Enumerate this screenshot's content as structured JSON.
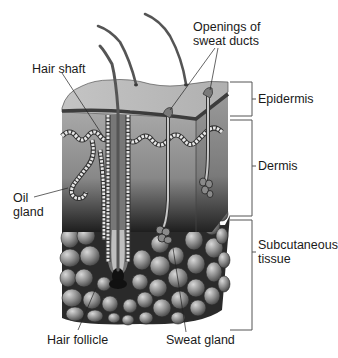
{
  "diagram": {
    "labels": {
      "hair_shaft": "Hair shaft",
      "openings_line1": "Openings of",
      "openings_line2": "sweat ducts",
      "epidermis": "Epidermis",
      "dermis": "Dermis",
      "oil_line1": "Oil",
      "oil_line2": "gland",
      "subcutaneous_line1": "Subcutaneous",
      "subcutaneous_line2": "tissue",
      "hair_follicle": "Hair follicle",
      "sweat_gland": "Sweat gland"
    },
    "layers": [
      {
        "name": "Epidermis"
      },
      {
        "name": "Dermis"
      },
      {
        "name": "Subcutaneous tissue"
      }
    ],
    "colors": {
      "background": "#ffffff",
      "epidermis": "#b5b5b5",
      "epidermis_band": "#4a4a4a",
      "dermis_top": "#9a9a9a",
      "dermis_bottom": "#2a2a2a",
      "fat_cell": "#8a8a8a",
      "text": "#1a1a1a"
    }
  }
}
